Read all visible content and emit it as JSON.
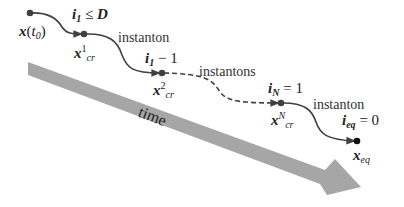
{
  "diagram": {
    "arrow_label": "time",
    "colors": {
      "arrow": "#a6a6a6",
      "path": "#404040",
      "dot": "#404040",
      "eq_dot": "#111111"
    },
    "states": [
      {
        "id": "x_t0",
        "base": "x",
        "paren": "(",
        "t": "t",
        "t_sub": "0",
        "close": ")"
      },
      {
        "id": "x_cr_1",
        "base": "x",
        "sup": "1",
        "sub": "cr"
      },
      {
        "id": "x_cr_2",
        "base": "x",
        "sup": "2",
        "sub": "cr"
      },
      {
        "id": "x_cr_N",
        "base": "x",
        "sup": "N",
        "sub": "cr"
      },
      {
        "id": "x_eq",
        "base": "x",
        "sub": "eq"
      }
    ],
    "indices": [
      {
        "base": "i",
        "sub": "1",
        "rel": " ≤ ",
        "rhs": "D"
      },
      {
        "base": "i",
        "sub": "1",
        "rel": " − ",
        "rhs": "1"
      },
      {
        "base": "i",
        "sub": "N",
        "rel": " = ",
        "rhs": "1"
      },
      {
        "base": "i",
        "sub": "eq",
        "rel": " = ",
        "rhs": "0"
      }
    ],
    "transitions": [
      {
        "label": "instanton",
        "style": "solid"
      },
      {
        "label": "instantons",
        "style": "dashed"
      },
      {
        "label": "instanton",
        "style": "solid"
      }
    ]
  }
}
